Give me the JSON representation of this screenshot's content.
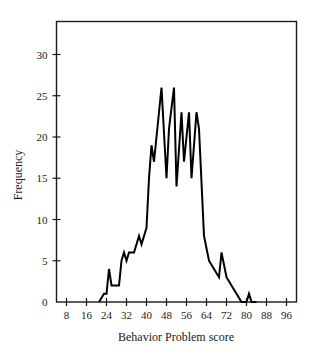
{
  "figure": {
    "background_color": "#ffffff",
    "line_color": "#000000",
    "axis_color": "#1a1a1a"
  },
  "chart_data": {
    "type": "line",
    "title": "",
    "subtitle": "",
    "xlabel": "Behavior Problem score",
    "ylabel": "Frequency",
    "xlim": [
      4,
      100
    ],
    "ylim": [
      0,
      34
    ],
    "xticks": [
      8,
      16,
      24,
      32,
      40,
      48,
      56,
      64,
      72,
      80,
      88,
      96
    ],
    "xtick_labels": [
      "8",
      "16",
      "24",
      "32",
      "40",
      "48",
      "56",
      "64",
      "72",
      "80",
      "88",
      "96"
    ],
    "yticks": [
      0,
      5,
      10,
      15,
      20,
      25,
      30
    ],
    "ytick_labels": [
      "0",
      "5",
      "10",
      "15",
      "20",
      "25",
      "30"
    ],
    "grid": false,
    "legend": false,
    "legend_position": "none",
    "annotations": [],
    "x": [
      21,
      23,
      24,
      25,
      26,
      27,
      28,
      29,
      30,
      31,
      32,
      33,
      34,
      35,
      36,
      37,
      38,
      39,
      40,
      41,
      42,
      43,
      44,
      45,
      46,
      47,
      48,
      49,
      50,
      51,
      52,
      53,
      54,
      55,
      56,
      57,
      58,
      59,
      60,
      61,
      62,
      63,
      64,
      65,
      66,
      67,
      68,
      69,
      70,
      71,
      72,
      73,
      74,
      75,
      76,
      77,
      78,
      79,
      80,
      81,
      82,
      83,
      84
    ],
    "y": [
      0,
      1,
      1,
      1,
      4,
      2,
      2,
      2,
      5,
      6,
      5,
      6,
      6,
      8,
      8,
      7,
      8,
      9,
      15,
      19,
      17,
      20,
      23,
      26,
      15,
      21,
      26,
      14,
      23,
      17,
      23,
      20,
      15,
      23,
      21,
      8,
      7,
      6,
      5,
      4,
      3,
      4,
      6,
      3,
      2,
      1,
      1,
      0,
      0,
      1,
      1,
      0,
      0
    ],
    "series": [
      {
        "name": "Behavior Problem score frequency polygon",
        "points": [
          {
            "x": 21,
            "y": 0
          },
          {
            "x": 23,
            "y": 1
          },
          {
            "x": 24,
            "y": 1
          },
          {
            "x": 25,
            "y": 4
          },
          {
            "x": 26,
            "y": 2
          },
          {
            "x": 28,
            "y": 2
          },
          {
            "x": 29,
            "y": 2
          },
          {
            "x": 30,
            "y": 5
          },
          {
            "x": 31,
            "y": 6
          },
          {
            "x": 32,
            "y": 5
          },
          {
            "x": 33,
            "y": 6
          },
          {
            "x": 35,
            "y": 6
          },
          {
            "x": 37,
            "y": 8
          },
          {
            "x": 38,
            "y": 7
          },
          {
            "x": 40,
            "y": 9
          },
          {
            "x": 41,
            "y": 15
          },
          {
            "x": 42,
            "y": 19
          },
          {
            "x": 43,
            "y": 17
          },
          {
            "x": 44,
            "y": 20
          },
          {
            "x": 46,
            "y": 26
          },
          {
            "x": 48,
            "y": 15
          },
          {
            "x": 49,
            "y": 21
          },
          {
            "x": 51,
            "y": 26
          },
          {
            "x": 52,
            "y": 14
          },
          {
            "x": 54,
            "y": 23
          },
          {
            "x": 55,
            "y": 17
          },
          {
            "x": 57,
            "y": 23
          },
          {
            "x": 58,
            "y": 15
          },
          {
            "x": 60,
            "y": 23
          },
          {
            "x": 61,
            "y": 21
          },
          {
            "x": 63,
            "y": 8
          },
          {
            "x": 65,
            "y": 5
          },
          {
            "x": 67,
            "y": 4
          },
          {
            "x": 69,
            "y": 3
          },
          {
            "x": 70,
            "y": 6
          },
          {
            "x": 72,
            "y": 3
          },
          {
            "x": 74,
            "y": 2
          },
          {
            "x": 76,
            "y": 1
          },
          {
            "x": 78,
            "y": 0
          },
          {
            "x": 80,
            "y": 0
          },
          {
            "x": 81,
            "y": 1
          },
          {
            "x": 82,
            "y": 0
          },
          {
            "x": 84,
            "y": 0
          }
        ]
      }
    ]
  }
}
